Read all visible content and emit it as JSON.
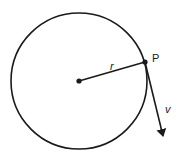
{
  "diagram": {
    "labels": {
      "radius": "r",
      "point": "P",
      "velocity": "v"
    },
    "colors": {
      "stroke": "#1a1a1a",
      "background": "#ffffff"
    }
  }
}
